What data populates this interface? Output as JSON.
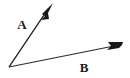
{
  "figure": {
    "kind": "angle-diagram",
    "background_color": "#ffffff",
    "stroke_color": "#2b2b2b",
    "label_color": "#1a1a1a",
    "width": 130,
    "height": 78
  },
  "vertex": {
    "x": 9,
    "y": 67
  },
  "rays": [
    {
      "id": "ray-a",
      "label": "A",
      "label_x": 22,
      "label_y": 29,
      "tip_x": 53,
      "tip_y": 3,
      "shaft_end_x": 48,
      "shaft_end_y": 9,
      "stroke_width": 1.1,
      "arrow_points": "53,3 42,14 45,16 41,20 49,19 48,13"
    },
    {
      "id": "ray-b",
      "label": "B",
      "label_x": 84,
      "label_y": 72,
      "tip_x": 123,
      "tip_y": 42,
      "shaft_end_x": 114,
      "shaft_end_y": 46,
      "stroke_width": 1.1,
      "arrow_points": "123,42 108,42 111,46 107,50 119,48 122,45"
    }
  ],
  "chart_data": {
    "type": "scatter",
    "title": "",
    "xlabel": "",
    "ylabel": "",
    "annotations": [
      "A",
      "B"
    ],
    "series": [
      {
        "name": "Ray A",
        "x": [
          9,
          53
        ],
        "y": [
          67,
          3
        ]
      },
      {
        "name": "Ray B",
        "x": [
          9,
          123
        ],
        "y": [
          67,
          42
        ]
      }
    ]
  }
}
